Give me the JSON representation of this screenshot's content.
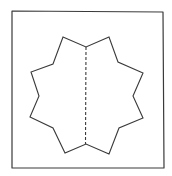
{
  "diagram": {
    "stroke_color": "#3a3a3a",
    "background": "#ffffff",
    "frame": {
      "points": "12,11 163,12 164,168 12,168"
    },
    "star": {
      "points": "63,37 86,47 109,37 118,62 143,73 133,96 143,118 119,128 109,154 86,144 65,153 53,128 30,117 39,96 31,72 53,64"
    },
    "fold_line": {
      "x1": 86,
      "y1": 47,
      "x2": 85.5,
      "y2": 144,
      "dash": "3,2"
    }
  }
}
